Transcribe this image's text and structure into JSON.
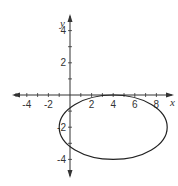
{
  "chart_data": {
    "type": "line",
    "title": "",
    "xlabel": "x",
    "ylabel": "y",
    "xlim": [
      -5,
      10
    ],
    "ylim": [
      -5,
      5
    ],
    "grid": false,
    "x_tick_labels": [
      "-4",
      "-2",
      "2",
      "4",
      "6",
      "8"
    ],
    "x_tick_values": [
      -4,
      -2,
      2,
      4,
      6,
      8
    ],
    "y_tick_labels": [
      "4",
      "2",
      "-2",
      "-4"
    ],
    "y_tick_values": [
      4,
      2,
      -2,
      -4
    ],
    "series": [
      {
        "name": "ellipse",
        "shape": "ellipse",
        "center": [
          4,
          -2
        ],
        "semi_axis_x": 5,
        "semi_axis_y": 2,
        "equation": "(x-4)^2/25 + (y+2)^2/4 = 1"
      }
    ]
  },
  "colors": {
    "axis": "#333333",
    "curve": "#222222"
  }
}
